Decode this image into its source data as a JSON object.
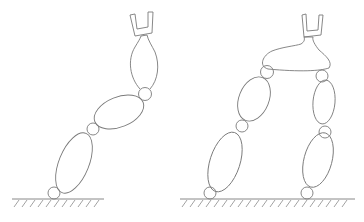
{
  "figure": {
    "description": "Line drawing comparing a serial robot arm (left) with a parallel two-leg robot (right), both with U-shaped grippers on hatched ground",
    "left_robot": {
      "type": "serial-arm",
      "links": 3,
      "joints": 3,
      "end_effector": "u-gripper"
    },
    "right_robot": {
      "type": "parallel-two-leg",
      "legs": 2,
      "links_per_leg": 2,
      "joints_per_leg": 3,
      "platform": "ellipse",
      "end_effector": "u-gripper"
    },
    "colors": {
      "stroke": "#7a7a7a",
      "background": "#ffffff"
    }
  }
}
